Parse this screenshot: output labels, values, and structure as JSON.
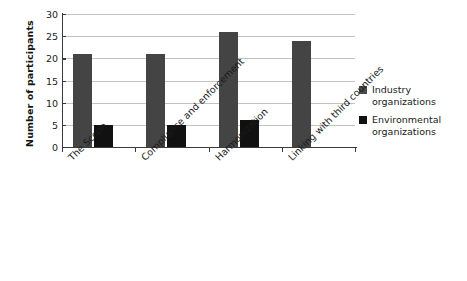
{
  "chart_data": {
    "type": "bar",
    "title": "",
    "subtitle": "",
    "xlabel": "",
    "ylabel": "Number of participants",
    "ylim": [
      0,
      30
    ],
    "ytick_step": 5,
    "yticks": [
      30,
      25,
      20,
      15,
      10,
      5,
      0
    ],
    "grid": true,
    "grid_axis": "y",
    "legend_position": "right",
    "categories": [
      "The Scope",
      "Compliance and enforcement",
      "Harmonization",
      "Linking with third countries"
    ],
    "series": [
      {
        "name": "Industry organizations",
        "color": "#444444",
        "values": [
          21,
          21,
          26,
          24
        ]
      },
      {
        "name": "Environmental organizations",
        "color": "#111111",
        "values": [
          5,
          5,
          6,
          null
        ]
      }
    ]
  },
  "legend": {
    "entries": [
      {
        "label_line1": "Industry",
        "label_line2": "organizations"
      },
      {
        "label_line1": "Environmental",
        "label_line2": "organizations"
      }
    ]
  },
  "colors": {
    "industry": "#444444",
    "environmental": "#111111",
    "gridline": "#c3c3c3",
    "axis": "#3a3a3a",
    "background": "#ffffff"
  }
}
